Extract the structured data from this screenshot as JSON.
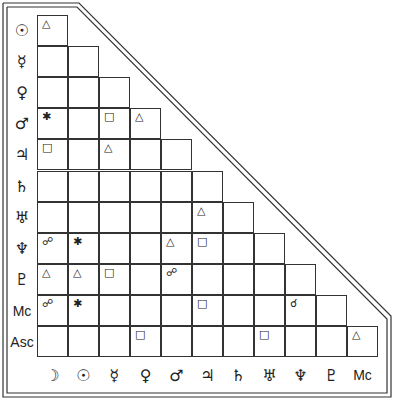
{
  "rows": [
    {
      "label": "☉",
      "name": "sun"
    },
    {
      "label": "☿",
      "name": "mercury"
    },
    {
      "label": "♀",
      "name": "venus"
    },
    {
      "label": "♂",
      "name": "mars"
    },
    {
      "label": "♃",
      "name": "jupiter"
    },
    {
      "label": "♄",
      "name": "saturn"
    },
    {
      "label": "♅",
      "name": "uranus"
    },
    {
      "label": "♆",
      "name": "neptune"
    },
    {
      "label": "♇",
      "name": "pluto"
    },
    {
      "label": "Mc",
      "name": "midheaven"
    },
    {
      "label": "Asc",
      "name": "ascendant"
    }
  ],
  "columns": [
    {
      "label": "☽",
      "name": "moon"
    },
    {
      "label": "☉",
      "name": "sun"
    },
    {
      "label": "☿",
      "name": "mercury"
    },
    {
      "label": "♀",
      "name": "venus"
    },
    {
      "label": "♂",
      "name": "mars"
    },
    {
      "label": "♃",
      "name": "jupiter"
    },
    {
      "label": "♄",
      "name": "saturn"
    },
    {
      "label": "♅",
      "name": "uranus"
    },
    {
      "label": "♆",
      "name": "neptune"
    },
    {
      "label": "♇",
      "name": "pluto"
    },
    {
      "label": "Mc",
      "name": "midheaven"
    }
  ],
  "aspect_symbols": {
    "trine": "△",
    "square": "□",
    "sextile": "✱",
    "opposition": "☍",
    "conjunction": "☌"
  },
  "grid": [
    [
      "△"
    ],
    [
      "",
      ""
    ],
    [
      "",
      "",
      ""
    ],
    [
      "✱",
      "",
      "□",
      "△"
    ],
    [
      "□",
      "",
      "△",
      "",
      ""
    ],
    [
      "",
      "",
      "",
      "",
      "",
      ""
    ],
    [
      "",
      "",
      "",
      "",
      "",
      "△",
      ""
    ],
    [
      "☍",
      "✱",
      "",
      "",
      "△",
      "□",
      "",
      ""
    ],
    [
      "△",
      "△",
      "□",
      "",
      "☍",
      "",
      "",
      "",
      ""
    ],
    [
      "☍",
      "✱",
      "",
      "",
      "",
      "□",
      "",
      "",
      "☌",
      ""
    ],
    [
      "",
      "",
      "",
      "□",
      "",
      "",
      "",
      "□",
      "",
      "",
      "△"
    ]
  ]
}
